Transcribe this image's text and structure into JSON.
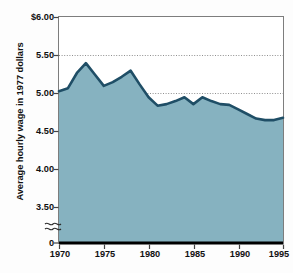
{
  "chart_data": {
    "type": "area",
    "title": "",
    "subtitle": "",
    "xlabel": "",
    "ylabel": "Average hourly wage in 1977 dollars",
    "x": [
      1970,
      1971,
      1972,
      1973,
      1974,
      1975,
      1976,
      1977,
      1978,
      1979,
      1980,
      1981,
      1982,
      1983,
      1984,
      1985,
      1986,
      1987,
      1988,
      1989,
      1990,
      1991,
      1992,
      1993,
      1994,
      1995
    ],
    "values": [
      5.03,
      5.07,
      5.27,
      5.4,
      5.25,
      5.1,
      5.15,
      5.22,
      5.3,
      5.12,
      4.95,
      4.84,
      4.86,
      4.9,
      4.95,
      4.86,
      4.95,
      4.9,
      4.86,
      4.85,
      4.79,
      4.73,
      4.67,
      4.65,
      4.65,
      4.68
    ],
    "series": [
      {
        "name": "Average hourly wage in 1977 dollars",
        "values": [
          5.03,
          5.07,
          5.27,
          5.4,
          5.25,
          5.1,
          5.15,
          5.22,
          5.3,
          5.12,
          4.95,
          4.84,
          4.86,
          4.9,
          4.95,
          4.86,
          4.95,
          4.9,
          4.86,
          4.85,
          4.79,
          4.73,
          4.67,
          4.65,
          4.65,
          4.68
        ]
      }
    ],
    "xlim": [
      1970,
      1995
    ],
    "ylim": [
      3.28,
      6.0
    ],
    "y_axis_broken": true,
    "y_break_below": 3.5,
    "y_ticks": [
      6.0,
      5.5,
      5.0,
      4.5,
      4.0,
      3.5,
      0
    ],
    "y_tick_labels": [
      "$6.00",
      "5.50",
      "5.00",
      "4.50",
      "4.00",
      "3.50",
      "0"
    ],
    "x_ticks": [
      1970,
      1975,
      1980,
      1985,
      1990,
      1995
    ],
    "x_tick_labels": [
      "1970",
      "1975",
      "1980",
      "1985",
      "1990",
      "1995"
    ],
    "gridlines": [
      5.5,
      5.0
    ],
    "grid": true,
    "legend": null,
    "legend_position": "none",
    "annotations": [],
    "colors": {
      "area_fill": "#86b2c0",
      "line": "#1f4e66",
      "gridline": "#9a9a9a",
      "axis": "#6d6d6d",
      "baseline": "#000000",
      "text": "#111111",
      "background": "#fdfdfd"
    }
  }
}
